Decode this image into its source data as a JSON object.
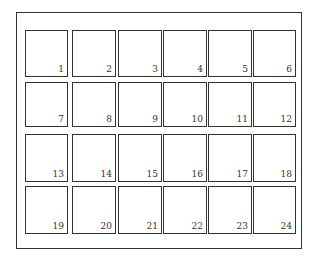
{
  "grid": {
    "rows": 4,
    "cols": 6,
    "labels": [
      "1",
      "2",
      "3",
      "4",
      "5",
      "6",
      "7",
      "8",
      "9",
      "10",
      "11",
      "12",
      "13",
      "14",
      "15",
      "16",
      "17",
      "18",
      "19",
      "20",
      "21",
      "22",
      "23",
      "24"
    ]
  },
  "layout": {
    "col_x": [
      25,
      72,
      118,
      163,
      208,
      253
    ],
    "col_w": [
      43,
      44,
      44,
      44,
      44,
      43
    ],
    "row_y": [
      30,
      82,
      134,
      186
    ],
    "row_h": [
      47,
      45,
      48,
      48
    ]
  }
}
